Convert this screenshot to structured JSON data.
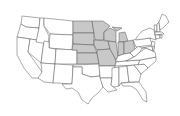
{
  "map": {
    "title": "",
    "region": "United States",
    "highlighted_region": "Midwest",
    "highlight_color": "#c8c8c8",
    "base_color": "#ffffff",
    "border_color": "#555555",
    "highlighted_states": [
      "ND",
      "SD",
      "NE",
      "KS",
      "MN",
      "IA",
      "MO",
      "WI",
      "IL",
      "MI",
      "IN",
      "OH"
    ],
    "states": [
      {
        "id": "WA",
        "fill": "#ffffff",
        "d": "M22,16 L40,18 L39,28 L26,27 L21,24 Z"
      },
      {
        "id": "OR",
        "fill": "#ffffff",
        "d": "M21,24 L26,27 L39,28 L37,40 L17,37 Z"
      },
      {
        "id": "CA",
        "fill": "#ffffff",
        "d": "M17,37 L30,39 L28,52 L42,72 L40,78 L32,78 L24,68 L17,55 Z"
      },
      {
        "id": "NV",
        "fill": "#ffffff",
        "d": "M30,39 L44,41 L41,63 L28,52 Z"
      },
      {
        "id": "ID",
        "fill": "#ffffff",
        "d": "M40,18 L44,18 L44,26 L49,36 L48,44 L36,42 L39,28 Z"
      },
      {
        "id": "MT",
        "fill": "#ffffff",
        "d": "M44,18 L73,21 L73,35 L50,34 L44,26 Z"
      },
      {
        "id": "WY",
        "fill": "#ffffff",
        "d": "M50,34 L73,35 L72,50 L49,48 Z"
      },
      {
        "id": "UT",
        "fill": "#ffffff",
        "d": "M44,41 L49,42 L49,48 L56,49 L55,64 L41,63 Z"
      },
      {
        "id": "AZ",
        "fill": "#ffffff",
        "d": "M41,63 L55,64 L53,83 L44,82 L38,78 L42,72 Z"
      },
      {
        "id": "CO",
        "fill": "#ffffff",
        "d": "M56,49 L77,50 L77,64 L55,64 Z"
      },
      {
        "id": "NM",
        "fill": "#ffffff",
        "d": "M55,64 L73,65 L72,84 L58,83 L53,83 Z"
      },
      {
        "id": "ND",
        "fill": "#c8c8c8",
        "d": "M73,21 L92,21 L94,33 L73,33 Z"
      },
      {
        "id": "SD",
        "fill": "#c8c8c8",
        "d": "M73,33 L94,33 L94,45 L73,44 Z"
      },
      {
        "id": "NE",
        "fill": "#c8c8c8",
        "d": "M73,44 L94,45 L97,53 L77,53 L77,50 L72,50 Z"
      },
      {
        "id": "KS",
        "fill": "#c8c8c8",
        "d": "M77,53 L97,53 L99,64 L77,64 Z"
      },
      {
        "id": "OK",
        "fill": "#ffffff",
        "d": "M73,65 L99,64 L100,76 L91,77 L82,74 L82,67 L73,67 Z"
      },
      {
        "id": "TX",
        "fill": "#ffffff",
        "d": "M73,67 L82,67 L82,74 L91,77 L100,76 L103,87 L98,93 L92,98 L88,104 L82,100 L78,92 L72,88 L66,89 L62,84 L72,84 Z"
      },
      {
        "id": "MN",
        "fill": "#c8c8c8",
        "d": "M92,21 L103,21 L110,26 L104,32 L104,40 L95,40 L94,33 Z"
      },
      {
        "id": "IA",
        "fill": "#c8c8c8",
        "d": "M94,40 L108,41 L110,49 L97,50 L94,45 Z"
      },
      {
        "id": "MO",
        "fill": "#c8c8c8",
        "d": "M97,50 L110,49 L116,60 L115,66 L99,66 L99,64 L97,53 Z"
      },
      {
        "id": "AR",
        "fill": "#ffffff",
        "d": "M99,66 L115,66 L112,78 L100,78 L100,76 Z"
      },
      {
        "id": "LA",
        "fill": "#ffffff",
        "d": "M100,78 L112,78 L111,85 L117,90 L108,92 L103,87 Z"
      },
      {
        "id": "WI",
        "fill": "#c8c8c8",
        "d": "M104,32 L110,28 L116,31 L116,42 L108,41 L104,40 Z"
      },
      {
        "id": "IL",
        "fill": "#c8c8c8",
        "d": "M108,41 L116,42 L118,56 L116,60 L110,49 Z"
      },
      {
        "id": "MI",
        "fill": "#c8c8c8",
        "d": "M112,27 L122,28 L117,31 Z M119,33 L125,32 L128,41 L119,42 Z"
      },
      {
        "id": "IN",
        "fill": "#c8c8c8",
        "d": "M118,42 L124,42 L124,54 L118,56 Z"
      },
      {
        "id": "OH",
        "fill": "#c8c8c8",
        "d": "M124,42 L133,40 L135,49 L130,53 L124,54 Z"
      },
      {
        "id": "KY",
        "fill": "#ffffff",
        "d": "M116,60 L118,56 L124,54 L130,53 L134,57 L126,61 L116,62 Z"
      },
      {
        "id": "TN",
        "fill": "#ffffff",
        "d": "M115,66 L116,62 L126,61 L140,60 L138,65 Z"
      },
      {
        "id": "MS",
        "fill": "#ffffff",
        "d": "M112,68 L119,67 L119,86 L114,87 L111,85 L112,78 Z"
      },
      {
        "id": "AL",
        "fill": "#ffffff",
        "d": "M119,67 L127,66 L129,82 L121,83 L119,86 Z"
      },
      {
        "id": "GA",
        "fill": "#ffffff",
        "d": "M127,66 L134,65 L141,74 L139,82 L129,82 Z"
      },
      {
        "id": "FL",
        "fill": "#ffffff",
        "d": "M121,83 L139,82 L146,92 L147,102 L143,100 L137,90 L131,86 L123,86 Z"
      },
      {
        "id": "SC",
        "fill": "#ffffff",
        "d": "M134,65 L144,64 L148,68 L141,74 Z"
      },
      {
        "id": "NC",
        "fill": "#ffffff",
        "d": "M138,65 L140,60 L156,57 L156,61 L148,68 L144,64 Z"
      },
      {
        "id": "VA",
        "fill": "#ffffff",
        "d": "M134,57 L140,52 L146,48 L155,52 L156,57 L140,60 L126,61 Z"
      },
      {
        "id": "WV",
        "fill": "#ffffff",
        "d": "M130,53 L135,49 L138,46 L142,48 L140,52 L134,57 Z"
      },
      {
        "id": "PA",
        "fill": "#ffffff",
        "d": "M133,40 L150,38 L152,45 L136,47 Z"
      },
      {
        "id": "NY",
        "fill": "#ffffff",
        "d": "M136,38 L142,31 L150,28 L154,30 L156,40 L150,38 L136,40 Z"
      },
      {
        "id": "NJ",
        "fill": "#ffffff",
        "d": "M152,41 L155,42 L154,49 L151,46 Z"
      },
      {
        "id": "MD",
        "fill": "#ffffff",
        "d": "M142,48 L152,46 L153,51 L146,48 Z"
      },
      {
        "id": "DE",
        "fill": "#ffffff",
        "d": "M152,46 L154,46 L154,51 L153,51 Z"
      },
      {
        "id": "VT",
        "fill": "#ffffff",
        "d": "M154,25 L157,25 L157,32 L155,32 Z"
      },
      {
        "id": "NH",
        "fill": "#ffffff",
        "d": "M157,24 L159,22 L160,32 L157,32 Z"
      },
      {
        "id": "ME",
        "fill": "#ffffff",
        "d": "M159,22 L162,14 L166,16 L169,22 L163,28 L160,30 Z"
      },
      {
        "id": "MA",
        "fill": "#ffffff",
        "d": "M155,32 L162,32 L164,34 L155,35 Z"
      },
      {
        "id": "CT",
        "fill": "#ffffff",
        "d": "M155,35 L160,35 L160,38 L156,39 Z"
      },
      {
        "id": "RI",
        "fill": "#ffffff",
        "d": "M160,35 L162,35 L162,38 L160,38 Z"
      }
    ]
  }
}
